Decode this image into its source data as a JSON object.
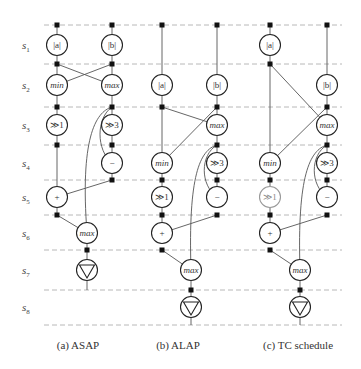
{
  "stages": [
    {
      "label": "s",
      "sub": "1",
      "y": 45
    },
    {
      "label": "s",
      "sub": "2",
      "y": 85
    },
    {
      "label": "s",
      "sub": "3",
      "y": 125
    },
    {
      "label": "s",
      "sub": "4",
      "y": 163
    },
    {
      "label": "s",
      "sub": "5",
      "y": 197
    },
    {
      "label": "s",
      "sub": "6",
      "y": 233
    },
    {
      "label": "s",
      "sub": "7",
      "y": 270
    },
    {
      "label": "s",
      "sub": "8",
      "y": 307
    }
  ],
  "boundaries_y": [
    25,
    64,
    107,
    145,
    180,
    215,
    250,
    290,
    325
  ],
  "panels": [
    {
      "id": "a",
      "caption": "(a)  ASAP"
    },
    {
      "id": "b",
      "caption": "(b)  ALAP"
    },
    {
      "id": "c",
      "caption": "(c)  TC schedule"
    }
  ],
  "node_labels": {
    "abs_a": "|a|",
    "abs_b": "|b|",
    "min": "min",
    "max": "max",
    "shr1": "≫1",
    "shr3": "≫3",
    "sub": "−",
    "add": "+",
    "max2": "max"
  },
  "colors": {
    "node_stroke": "#222222",
    "faded_node_stroke": "#999999",
    "edge": "#555555",
    "dash": "#b8b8b8",
    "register": "#111111"
  }
}
